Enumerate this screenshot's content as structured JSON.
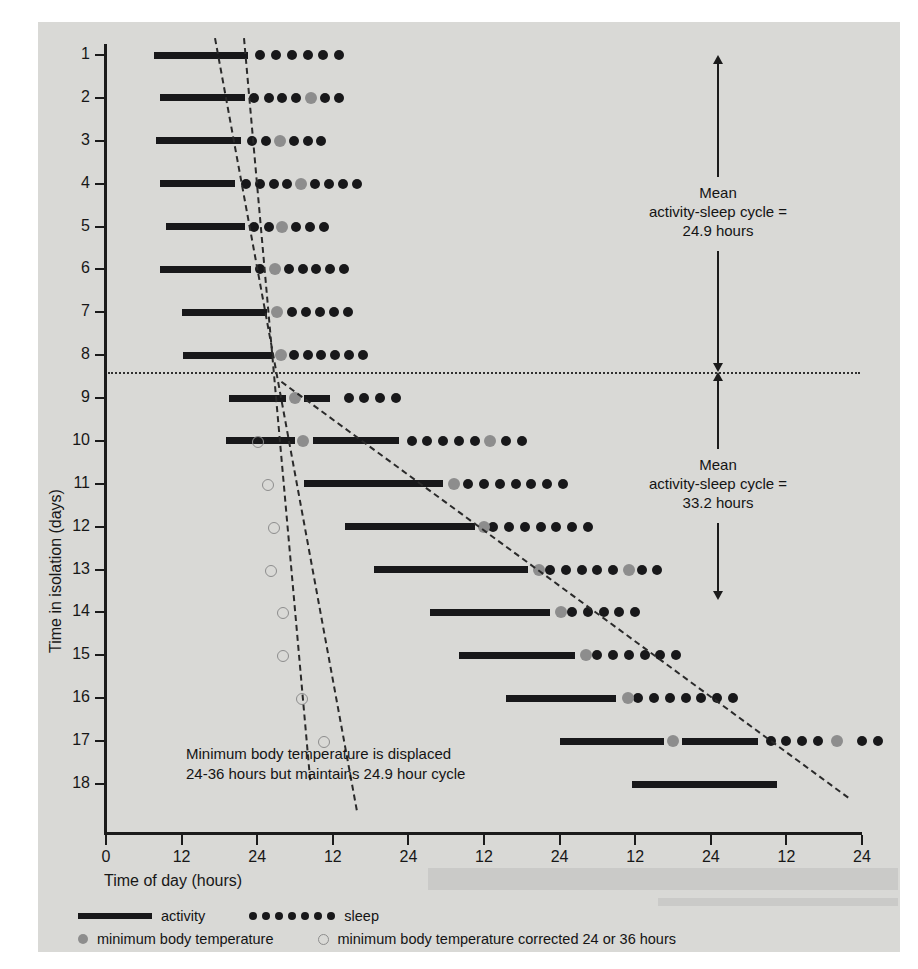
{
  "chart_data": {
    "type": "scatter",
    "title": "",
    "xlabel": "Time of day (hours)",
    "ylabel": "Time in isolation (days)",
    "xlim": [
      0,
      120
    ],
    "ylim": [
      1,
      18
    ],
    "grid": false,
    "legend_position": "bottom",
    "xticks": [
      {
        "value": 0,
        "label": "0"
      },
      {
        "value": 12,
        "label": "12"
      },
      {
        "value": 24,
        "label": "24"
      },
      {
        "value": 36,
        "label": "12"
      },
      {
        "value": 48,
        "label": "24"
      },
      {
        "value": 60,
        "label": "12"
      },
      {
        "value": 72,
        "label": "24"
      },
      {
        "value": 84,
        "label": "12"
      },
      {
        "value": 96,
        "label": "24"
      },
      {
        "value": 108,
        "label": "12"
      },
      {
        "value": 120,
        "label": "24"
      }
    ],
    "yticks": [
      "1",
      "2",
      "3",
      "4",
      "5",
      "6",
      "7",
      "8",
      "9",
      "10",
      "11",
      "12",
      "13",
      "14",
      "15",
      "16",
      "17",
      "18"
    ],
    "series": [
      {
        "name": "activity",
        "marker": "bar",
        "color": "#18181a"
      },
      {
        "name": "sleep",
        "marker": "filled-dot",
        "color": "#18181a"
      },
      {
        "name": "minimum body temperature",
        "marker": "gray-dot",
        "color": "#8d8d8d"
      },
      {
        "name": "minimum body temperature corrected 24 or 36 hours",
        "marker": "open-dot",
        "color": "#8d8d8d"
      }
    ],
    "days": [
      {
        "day": 1,
        "activity": [
          [
            7.6,
            22.5
          ]
        ],
        "sleep": [
          24.5,
          27.0,
          29.5,
          32.0,
          34.5,
          37.0
        ],
        "temp_min": [],
        "temp_corrected": []
      },
      {
        "day": 2,
        "activity": [
          [
            8.5,
            22.0
          ]
        ],
        "sleep": [
          23.5,
          25.8,
          28.0,
          30.2,
          34.8,
          37.0
        ],
        "temp_min": [
          32.5
        ],
        "temp_corrected": []
      },
      {
        "day": 3,
        "activity": [
          [
            8.0,
            21.5
          ]
        ],
        "sleep": [
          23.2,
          25.4,
          29.8,
          32.0,
          34.2
        ],
        "temp_min": [
          27.6
        ],
        "temp_corrected": []
      },
      {
        "day": 4,
        "activity": [
          [
            8.5,
            20.5
          ]
        ],
        "sleep": [
          22.2,
          24.4,
          26.6,
          28.8,
          33.2,
          35.4,
          37.6,
          39.8
        ],
        "temp_min": [
          31.0
        ],
        "temp_corrected": []
      },
      {
        "day": 5,
        "activity": [
          [
            9.5,
            22.0
          ]
        ],
        "sleep": [
          23.5,
          25.8,
          30.2,
          32.4,
          34.6
        ],
        "temp_min": [
          28.0
        ],
        "temp_corrected": []
      },
      {
        "day": 6,
        "activity": [
          [
            8.5,
            23.0
          ]
        ],
        "sleep": [
          24.5,
          29.0,
          31.2,
          33.4,
          35.6,
          37.8
        ],
        "temp_min": [
          26.8
        ],
        "temp_corrected": []
      },
      {
        "day": 7,
        "activity": [
          [
            12.0,
            25.5
          ]
        ],
        "sleep": [
          29.6,
          31.8,
          34.0,
          36.2,
          38.4
        ],
        "temp_min": [
          27.2
        ],
        "temp_corrected": []
      },
      {
        "day": 8,
        "activity": [
          [
            12.3,
            26.5
          ]
        ],
        "sleep": [
          29.8,
          32.0,
          34.2,
          36.4,
          38.6,
          40.8
        ],
        "temp_min": [
          27.8
        ],
        "temp_corrected": []
      },
      {
        "day": 9,
        "activity": [
          [
            19.5,
            28.5
          ],
          [
            31.5,
            35.5
          ]
        ],
        "sleep": [
          38.5,
          41.0,
          43.5,
          46.0
        ],
        "temp_min": [
          30.0
        ],
        "temp_corrected": []
      },
      {
        "day": 10,
        "activity": [
          [
            19.0,
            30.0
          ],
          [
            32.8,
            46.5
          ]
        ],
        "sleep": [
          48.5,
          51.0,
          53.5,
          56.0,
          58.5,
          63.5,
          66.0
        ],
        "temp_min": [
          31.3,
          61.0
        ],
        "temp_corrected": [
          24.0
        ]
      },
      {
        "day": 11,
        "activity": [
          [
            31.5,
            53.5
          ]
        ],
        "sleep": [
          57.5,
          60.0,
          62.5,
          65.0,
          67.5,
          70.0,
          72.5
        ],
        "temp_min": [
          55.2
        ],
        "temp_corrected": [
          25.5
        ]
      },
      {
        "day": 12,
        "activity": [
          [
            38.0,
            58.5
          ]
        ],
        "sleep": [
          61.5,
          64.0,
          66.5,
          69.0,
          71.5,
          74.0,
          76.5
        ],
        "temp_min": [
          60.0
        ],
        "temp_corrected": [
          26.5
        ]
      },
      {
        "day": 13,
        "activity": [
          [
            42.5,
            67.0
          ]
        ],
        "sleep": [
          70.5,
          73.0,
          75.5,
          78.0,
          80.5,
          85.0,
          87.5
        ],
        "temp_min": [
          68.8,
          83.0
        ],
        "temp_corrected": [
          26.0
        ]
      },
      {
        "day": 14,
        "activity": [
          [
            51.5,
            70.5
          ]
        ],
        "sleep": [
          74.0,
          76.5,
          79.0,
          81.5,
          84.0
        ],
        "temp_min": [
          72.2
        ],
        "temp_corrected": [
          28.0
        ]
      },
      {
        "day": 15,
        "activity": [
          [
            56.0,
            74.5
          ]
        ],
        "sleep": [
          78.0,
          80.5,
          83.0,
          85.5,
          88.0,
          90.5
        ],
        "temp_min": [
          76.2
        ],
        "temp_corrected": [
          28.0
        ]
      },
      {
        "day": 16,
        "activity": [
          [
            63.5,
            81.0
          ]
        ],
        "sleep": [
          84.5,
          87.0,
          89.5,
          92.0,
          94.5,
          97.0,
          99.5
        ],
        "temp_min": [
          82.8
        ],
        "temp_corrected": [
          31.0
        ]
      },
      {
        "day": 17,
        "activity": [
          [
            72.0,
            88.5
          ],
          [
            91.5,
            103.5
          ]
        ],
        "sleep": [
          105.5,
          108.0,
          110.5,
          113.0,
          120.0,
          122.5
        ],
        "temp_min": [
          90.0,
          116.0
        ],
        "temp_corrected": [
          34.5
        ]
      },
      {
        "day": 18,
        "activity": [
          [
            83.5,
            106.5
          ]
        ],
        "sleep": [],
        "temp_min": [],
        "temp_corrected": []
      }
    ],
    "trendlines": [
      {
        "name": "activity-onset-trend-early",
        "x1": 17.5,
        "y1": 0.6,
        "x2": 40.0,
        "y2": 18.6
      },
      {
        "name": "activity-onset-trend-late",
        "x1": 28.0,
        "y1": 8.6,
        "x2": 118.0,
        "y2": 18.3
      },
      {
        "name": "corrected-temperature-trend",
        "x1": 22.0,
        "y1": 0.6,
        "x2": 32.5,
        "y2": 17.9
      }
    ],
    "divider": {
      "name": "day-8-divider",
      "y": 8.4
    },
    "annotations": [
      {
        "id": "mean-cycle-upper",
        "lines": [
          "Mean",
          "activity-sleep cycle =",
          "24.9 hours"
        ],
        "arrow": "double",
        "y_top": 1.0,
        "y_bottom": 8.4
      },
      {
        "id": "mean-cycle-lower",
        "lines": [
          "Mean",
          "activity-sleep cycle =",
          "33.2 hours"
        ],
        "arrow": "double",
        "y_top": 8.4,
        "y_bottom": 13.7
      },
      {
        "id": "temperature-note",
        "lines": [
          "Minimum body temperature is displaced",
          "24-36 hours but maintains 24.9 hour cycle"
        ],
        "arrow": "none"
      }
    ]
  },
  "axes": {
    "ylabel": "Time in isolation (days)",
    "xlabel": "Time of day (hours)"
  },
  "legend": {
    "activity_label": "activity",
    "sleep_label": "sleep",
    "temp_label": "minimum body temperature",
    "temp_corrected_label": "minimum body temperature corrected 24 or 36 hours"
  },
  "colors": {
    "background": "#d9d9d6",
    "ink": "#18181a",
    "temperature_gray": "#8d8d8d",
    "axis": "#1b1b1b"
  }
}
